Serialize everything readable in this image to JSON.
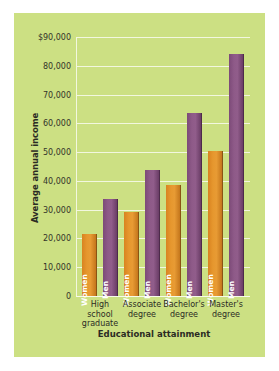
{
  "chart_data": {
    "type": "bar",
    "title": "",
    "xlabel": "Educational attainment",
    "ylabel": "Average annual income",
    "categories": [
      "High school graduate",
      "Associate degree",
      "Bachelor's degree",
      "Master's degree"
    ],
    "category_lines": [
      [
        "High",
        "school",
        "graduate"
      ],
      [
        "Associate",
        "degree"
      ],
      [
        "Bachelor's",
        "degree"
      ],
      [
        "Master's",
        "degree"
      ]
    ],
    "series": [
      {
        "name": "Women",
        "color": "#e0901f",
        "values": [
          21500,
          29200,
          38600,
          50400
        ]
      },
      {
        "name": "Men",
        "color": "#8a5684",
        "values": [
          33700,
          43800,
          63600,
          84100
        ]
      }
    ],
    "ylim": [
      0,
      90000
    ],
    "yticks": [
      0,
      10000,
      20000,
      30000,
      40000,
      50000,
      60000,
      70000,
      80000,
      90000
    ],
    "ytick_labels": [
      "0",
      "10,000",
      "20,000",
      "30,000",
      "40,000",
      "50,000",
      "60,000",
      "70,000",
      "80,000",
      "$90,000"
    ],
    "grid": true,
    "legend": "in-bar",
    "background_color": "#cce083",
    "gridline_color": "#f2f7df"
  }
}
